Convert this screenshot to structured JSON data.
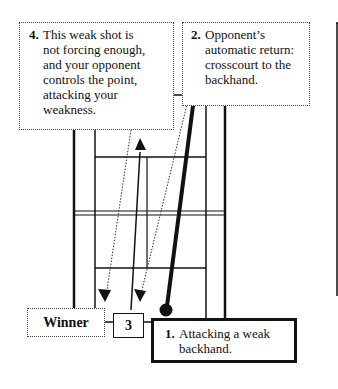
{
  "diagram": {
    "callouts": [
      {
        "number": "4.",
        "lines": [
          "This weak shot is",
          "not forcing enough,",
          "and your opponent",
          "controls the point,",
          "attacking your",
          "weakness."
        ]
      },
      {
        "number": "2.",
        "lines": [
          "Opponent’s",
          "automatic return:",
          "crosscourt to the",
          "backhand."
        ]
      },
      {
        "number": "1.",
        "lines": [
          "Attacking a weak",
          "backhand."
        ]
      }
    ],
    "labels": {
      "winner": "Winner",
      "shot3": "3"
    },
    "colors": {
      "line": "#111111",
      "background": "#ffffff"
    }
  }
}
